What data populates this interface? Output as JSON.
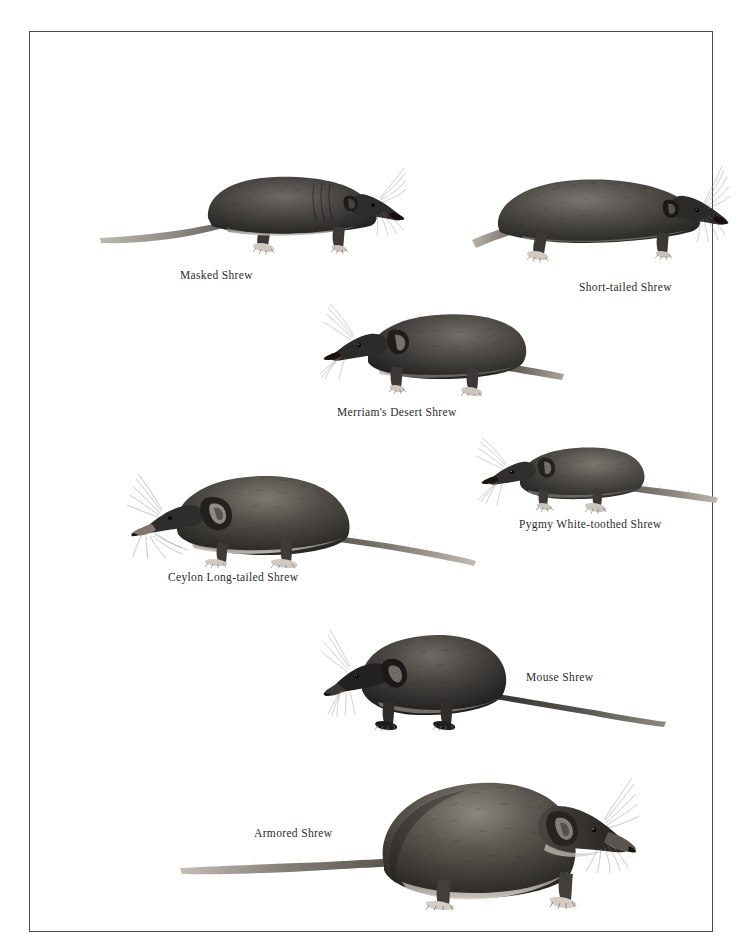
{
  "plate": {
    "background_color": "#ffffff",
    "border_color": "#4a4a4a",
    "ink_color": "#2b2b2b",
    "title": ""
  },
  "figures": [
    {
      "id": "masked",
      "caption": "Masked Shrew",
      "facing": "right",
      "body_length_px": 300,
      "has_long_tail": true
    },
    {
      "id": "shorttailed",
      "caption": "Short-tailed Shrew",
      "facing": "right",
      "body_length_px": 250,
      "has_long_tail": false
    },
    {
      "id": "merriams",
      "caption": "Merriam's Desert Shrew",
      "facing": "left",
      "body_length_px": 250,
      "has_long_tail": true
    },
    {
      "id": "pygmy",
      "caption": "Pygmy White-toothed Shrew",
      "facing": "left",
      "body_length_px": 235,
      "has_long_tail": true
    },
    {
      "id": "ceylon",
      "caption": "Ceylon Long-tailed Shrew",
      "facing": "left",
      "body_length_px": 350,
      "has_long_tail": true
    },
    {
      "id": "mouse",
      "caption": "Mouse Shrew",
      "facing": "left",
      "body_length_px": 340,
      "has_long_tail": true
    },
    {
      "id": "armored",
      "caption": "Armored Shrew",
      "facing": "right",
      "body_length_px": 450,
      "has_long_tail": true
    }
  ]
}
